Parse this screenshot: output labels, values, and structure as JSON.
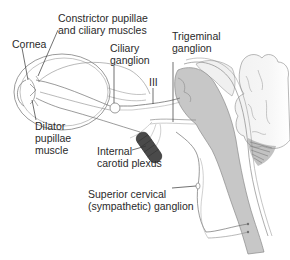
{
  "diagram": {
    "type": "anatomical-illustration",
    "colors": {
      "line": "#6b6b6b",
      "brainstem_fill": "#c9c9c9",
      "cord_fill": "#c4c4c4",
      "plexus_fill": "#4a4a4a",
      "text": "#2a2a2a",
      "background": "#ffffff"
    },
    "labels": {
      "constrictor_line1": "Constrictor pupillae",
      "constrictor_line2": "and ciliary muscles",
      "cornea": "Cornea",
      "ciliary_line1": "Ciliary",
      "ciliary_line2": "ganglion",
      "trigeminal_line1": "Trigeminal",
      "trigeminal_line2": "ganglion",
      "cn3": "III",
      "dilator_line1": "Dilator",
      "dilator_line2": "pupillae",
      "dilator_line3": "muscle",
      "carotid_line1": "Internal",
      "carotid_line2": "carotid plexus",
      "cervical_line1": "Superior cervical",
      "cervical_line2": "(sympathetic) ganglion"
    }
  }
}
